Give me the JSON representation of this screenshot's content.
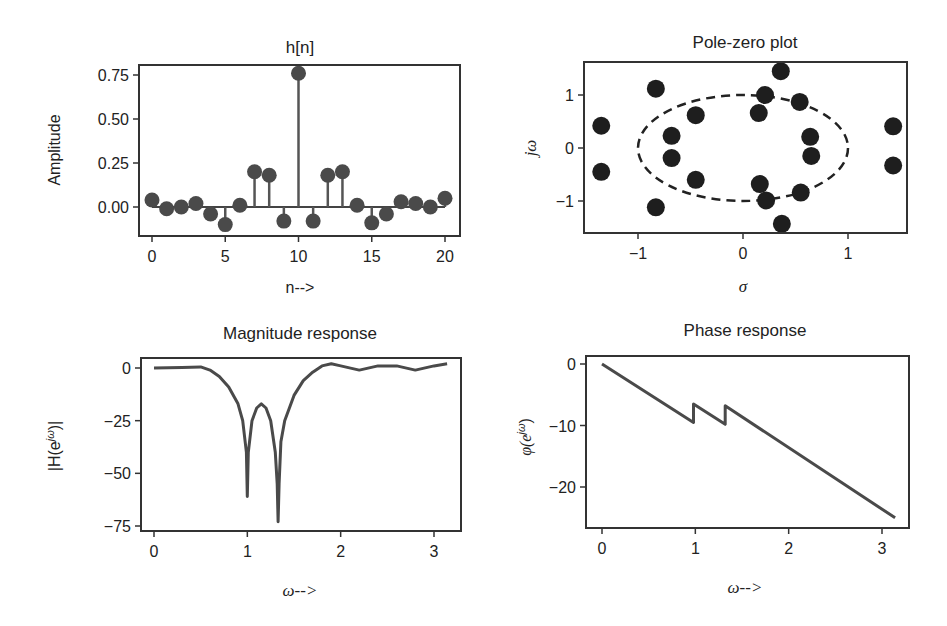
{
  "chart_data": [
    {
      "type": "stem",
      "title": "h[n]",
      "xlabel": "n-->",
      "ylabel": "Amplitude",
      "x": [
        0,
        1,
        2,
        3,
        4,
        5,
        6,
        7,
        8,
        9,
        10,
        11,
        12,
        13,
        14,
        15,
        16,
        17,
        18,
        19,
        20
      ],
      "values": [
        0.04,
        -0.01,
        0.0,
        0.02,
        -0.04,
        -0.1,
        0.01,
        0.2,
        0.18,
        -0.08,
        0.76,
        -0.08,
        0.18,
        0.2,
        0.01,
        -0.09,
        -0.04,
        0.03,
        0.02,
        0.0,
        0.05
      ],
      "xticks": [
        "0",
        "5",
        "10",
        "15",
        "20"
      ],
      "yticks": [
        "0.00",
        "0.25",
        "0.50",
        "0.75"
      ],
      "xlim": [
        -1,
        21
      ],
      "ylim": [
        -0.13,
        0.79
      ],
      "grid": false
    },
    {
      "type": "scatter",
      "title": "Pole-zero plot",
      "xlabel": "σ",
      "ylabel": "jω",
      "points": [
        [
          -1.35,
          0.42
        ],
        [
          -1.35,
          -0.45
        ],
        [
          -0.83,
          1.12
        ],
        [
          -0.83,
          -1.12
        ],
        [
          -0.68,
          0.23
        ],
        [
          -0.68,
          -0.19
        ],
        [
          -0.45,
          0.62
        ],
        [
          -0.45,
          -0.6
        ],
        [
          0.15,
          0.66
        ],
        [
          0.16,
          -0.68
        ],
        [
          0.21,
          1.0
        ],
        [
          0.22,
          -0.99
        ],
        [
          0.36,
          1.45
        ],
        [
          0.37,
          -1.43
        ],
        [
          0.54,
          0.87
        ],
        [
          0.55,
          -0.84
        ],
        [
          0.64,
          0.21
        ],
        [
          0.65,
          -0.15
        ],
        [
          1.43,
          0.41
        ],
        [
          1.43,
          -0.33
        ]
      ],
      "annotations": [
        "dashed unit circle centered at origin"
      ],
      "xticks": [
        "−1",
        "0",
        "1"
      ],
      "yticks": [
        "−1",
        "0",
        "1"
      ],
      "xlim": [
        -1.5,
        1.57
      ],
      "ylim": [
        -1.6,
        1.63
      ],
      "grid": false
    },
    {
      "type": "line",
      "title": "Magnitude response",
      "xlabel": "ω-->",
      "ylabel": "|H(e^jω)|",
      "x": [
        0,
        0.3,
        0.5,
        0.6,
        0.7,
        0.8,
        0.9,
        0.95,
        0.99,
        1.0,
        1.01,
        1.05,
        1.1,
        1.15,
        1.2,
        1.25,
        1.3,
        1.32,
        1.33,
        1.34,
        1.36,
        1.4,
        1.5,
        1.6,
        1.7,
        1.8,
        1.9,
        2.0,
        2.2,
        2.4,
        2.6,
        2.8,
        3.0,
        3.14
      ],
      "values": [
        0,
        0.3,
        0.5,
        -1,
        -4,
        -9,
        -17,
        -25,
        -40,
        -61,
        -40,
        -25,
        -19,
        -17,
        -19,
        -25,
        -40,
        -55,
        -73,
        -55,
        -35,
        -25,
        -13,
        -6,
        -2,
        1,
        2,
        1,
        -1,
        1,
        1,
        -1,
        1,
        2
      ],
      "xticks": [
        "0",
        "1",
        "2",
        "3"
      ],
      "yticks": [
        "0",
        "−25",
        "−50",
        "−75"
      ],
      "xlim": [
        -0.14,
        3.3
      ],
      "ylim": [
        -78,
        4
      ],
      "grid": false
    },
    {
      "type": "line",
      "title": "Phase response",
      "xlabel": "ω-->",
      "ylabel": "φ(e^jω)",
      "x": [
        0,
        0.98,
        0.98,
        1.32,
        1.32,
        3.14
      ],
      "values": [
        0,
        -9.5,
        -6.5,
        -9.8,
        -6.8,
        -25
      ],
      "xticks": [
        "0",
        "1",
        "2",
        "3"
      ],
      "yticks": [
        "0",
        "−10",
        "−20"
      ],
      "xlim": [
        -0.17,
        3.36
      ],
      "ylim": [
        -26.5,
        1.3
      ],
      "grid": false
    }
  ],
  "labels": {
    "p1": {
      "title": "h[n]",
      "xlabel": "n-->",
      "ylabel": "Amplitude",
      "xticks": [
        "0",
        "5",
        "10",
        "15",
        "20"
      ],
      "yticks": [
        "0.75",
        "0.50",
        "0.25",
        "0.00"
      ]
    },
    "p2": {
      "title": "Pole-zero plot",
      "xlabel": "σ",
      "ylabel": "jω",
      "xticks": [
        "−1",
        "0",
        "1"
      ],
      "yticks": [
        "1",
        "0",
        "−1"
      ]
    },
    "p3": {
      "title": "Magnitude response",
      "xlabel": "ω-->",
      "ylabel_main": "|H(e",
      "ylabel_sup": "jω",
      "ylabel_end": ")|",
      "xticks": [
        "0",
        "1",
        "2",
        "3"
      ],
      "yticks": [
        "0",
        "−25",
        "−50",
        "−75"
      ]
    },
    "p4": {
      "title": "Phase response",
      "xlabel": "ω-->",
      "ylabel_main": "φ(e",
      "ylabel_sup": "jω",
      "ylabel_end": ")",
      "xticks": [
        "0",
        "1",
        "2",
        "3"
      ],
      "yticks": [
        "0",
        "−10",
        "−20"
      ]
    }
  }
}
